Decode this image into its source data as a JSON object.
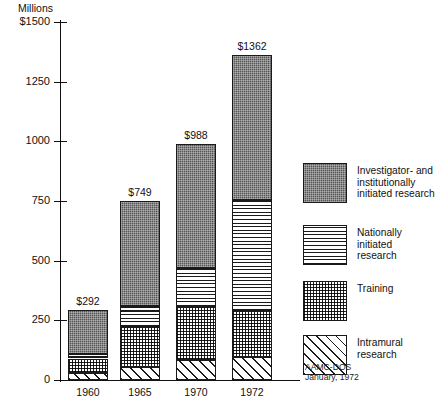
{
  "chart_data": {
    "type": "bar",
    "title": "",
    "subtitle": "",
    "ylabel": "Millions",
    "xlabel": "",
    "ylim": [
      0,
      1500
    ],
    "yticks": [
      0,
      250,
      500,
      750,
      1000,
      1250,
      1500
    ],
    "ytick_labels": [
      "0",
      "250",
      "500",
      "750",
      "1000",
      "1250",
      "$1500"
    ],
    "grid": false,
    "stacked": true,
    "legend_position": "right",
    "categories": [
      "1960",
      "1965",
      "1970",
      "1972"
    ],
    "totals": [
      292,
      749,
      988,
      1362
    ],
    "total_labels": [
      "$292",
      "$749",
      "$988",
      "$1362"
    ],
    "series": [
      {
        "name": "Investigator- and institutionally initiated research",
        "pattern": "dark-stipple",
        "values": [
          184,
          438,
          518,
          607
        ]
      },
      {
        "name": "Nationally initiated research",
        "pattern": "horizontal-lines",
        "values": [
          18,
          90,
          165,
          465
        ]
      },
      {
        "name": "Training",
        "pattern": "dotted-grid",
        "values": [
          62,
          168,
          222,
          195
        ]
      },
      {
        "name": "Intramural research",
        "pattern": "diagonal-hatch",
        "values": [
          28,
          53,
          83,
          95
        ]
      }
    ]
  },
  "legend": {
    "items": [
      {
        "label": "Investigator- and\ninstitutionally\ninitiated research",
        "pattern": "dark-stipple"
      },
      {
        "label": "Nationally initiated\nresearch",
        "pattern": "horizontal-lines"
      },
      {
        "label": "Training",
        "pattern": "dotted-grid"
      },
      {
        "label": "Intramural research",
        "pattern": "diagonal-hatch"
      }
    ]
  },
  "source_note": "AAMC-DOS\nJanuary, 1972"
}
